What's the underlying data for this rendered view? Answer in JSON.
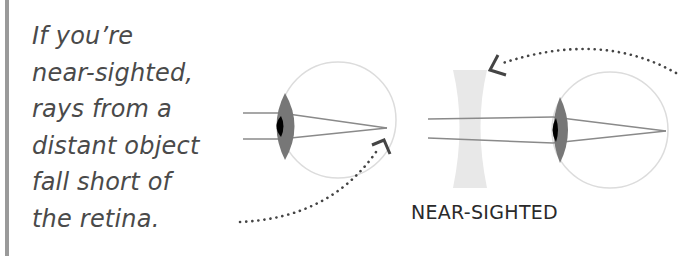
{
  "caption": {
    "lines": [
      "If you’re",
      "near-sighted,",
      "rays from a",
      "distant object",
      "fall short of",
      "the retina."
    ]
  },
  "label": "NEAR-SIGHTED",
  "colors": {
    "sidebar_bar": "#9a9a9a",
    "text": "#4a4a4a",
    "eye_outline": "#d8d8d8",
    "lens": "#777777",
    "pupil": "#000000",
    "rays": "#8a8a8a",
    "concave_lens": "#e6e6e6",
    "dots": "#444444"
  },
  "diagram": {
    "uncorrected_eye": "eye with rays focusing in front of retina",
    "corrected_eye": "concave lens in front of eye, rays focus on retina"
  }
}
